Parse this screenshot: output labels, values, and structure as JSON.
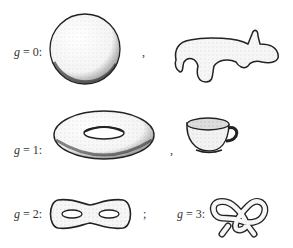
{
  "diagram": {
    "rows": [
      {
        "label_var": "g",
        "label_eq": " = 0:",
        "genus": 0,
        "items": [
          "sphere",
          "blob-animal"
        ],
        "separator": ","
      },
      {
        "label_var": "g",
        "label_eq": " = 1:",
        "genus": 1,
        "items": [
          "torus",
          "teacup"
        ],
        "separator": ","
      },
      {
        "label_var": "g",
        "label_eq": " = 2:",
        "genus": 2,
        "items": [
          "double-torus"
        ],
        "separator": ";"
      },
      {
        "label_var": "g",
        "label_eq": " = 3:",
        "genus": 3,
        "items": [
          "pretzel"
        ],
        "separator": ""
      }
    ]
  }
}
